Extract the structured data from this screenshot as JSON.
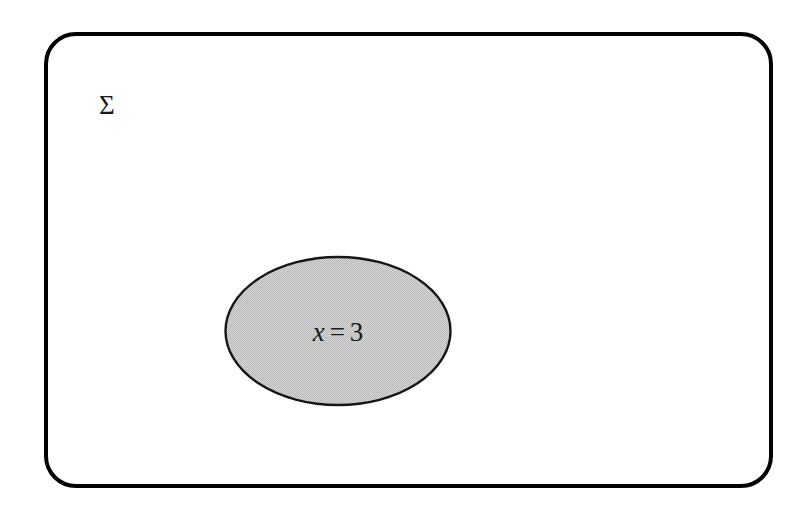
{
  "diagram": {
    "type": "venn-diagram",
    "background_color": "#ffffff",
    "universe": {
      "shape": "rounded-rectangle",
      "label": "Σ",
      "label_meaning": "sigma-universal-set",
      "stroke_color": "#000000",
      "fill_color": "#ffffff",
      "stroke_width_px": 4,
      "corner_radius_px": 32,
      "x": 44,
      "y": 32,
      "width": 729,
      "height": 456
    },
    "subset": {
      "shape": "ellipse",
      "label_parts": {
        "variable": "x",
        "relation": "=",
        "value": "3"
      },
      "label_text": "x = 3",
      "stroke_color": "#161616",
      "fill_color": "#c8c8c8",
      "fill_pattern": "halftone-dither",
      "stroke_width_px": 2,
      "center_x": 338,
      "center_y": 331,
      "width": 228,
      "height": 150
    }
  }
}
